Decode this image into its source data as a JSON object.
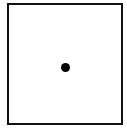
{
  "figure": {
    "shape": "square",
    "dot_count": 1,
    "border_color": "#111111",
    "dot_color": "#000000",
    "background_color": "#ffffff"
  }
}
